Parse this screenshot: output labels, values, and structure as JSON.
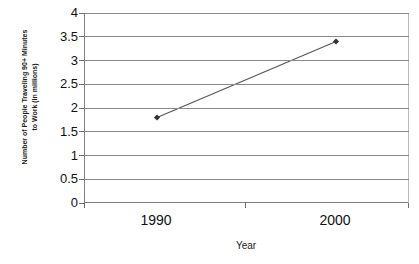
{
  "chart_data": {
    "type": "line",
    "title": "1990-2000",
    "title_clipped": true,
    "xlabel": "Year",
    "ylabel": "Number of People Traveling 90+ Minutes to Work (in millions)",
    "ylabel_lines": [
      "Number of People Traveling 90+ Minutes",
      "to Work (in millions)"
    ],
    "categories": [
      "1990",
      "2000"
    ],
    "x": [
      1990,
      2000
    ],
    "values": [
      1.8,
      3.4
    ],
    "series": [
      {
        "name": "Number of People Traveling 90+ Minutes to Work (in millions)",
        "values": [
          1.8,
          3.4
        ]
      }
    ],
    "ylim": [
      0,
      4
    ],
    "ytick_labels": [
      "0",
      "0.5",
      "1",
      "1.5",
      "2",
      "2.5",
      "3",
      "3.5",
      "4"
    ],
    "ytick_values": [
      0,
      0.5,
      1,
      1.5,
      2,
      2.5,
      3,
      3.5,
      4
    ],
    "xtick_labels": [
      "1990",
      "2000"
    ],
    "grid": true,
    "grid_axis": "y",
    "legend": false,
    "legend_position": "none",
    "marker": "diamond",
    "line_color": "#555555",
    "marker_color": "#333333",
    "gridline_color": "#8a8a8a",
    "background_color": "#ffffff"
  }
}
